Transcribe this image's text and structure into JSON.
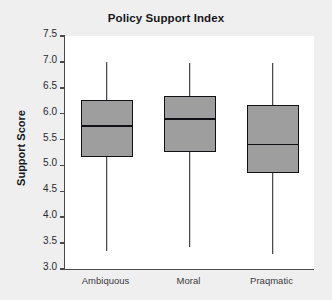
{
  "chart_data": {
    "type": "box",
    "title": "Policy Support Index",
    "xlabel": "",
    "ylabel": "Support Score",
    "categories": [
      "Ambiquous",
      "Moral",
      "Praqmatic"
    ],
    "ylim": [
      3.0,
      7.5
    ],
    "yticks": [
      "3.0",
      "3.5",
      "4.0",
      "4.5",
      "5.0",
      "5.5",
      "6.0",
      "6.5",
      "7.0",
      "7.5"
    ],
    "ytick_values": [
      3.0,
      3.5,
      4.0,
      4.5,
      5.0,
      5.5,
      6.0,
      6.5,
      7.0,
      7.5
    ],
    "grid": false,
    "legend": false,
    "boxes": [
      {
        "category": "Ambiquous",
        "whisker_low": 3.35,
        "q1": 5.16,
        "median": 5.78,
        "q3": 6.27,
        "whisker_high": 7.0
      },
      {
        "category": "Moral",
        "whisker_low": 3.42,
        "q1": 5.25,
        "median": 5.92,
        "q3": 6.35,
        "whisker_high": 6.98
      },
      {
        "category": "Praqmatic",
        "whisker_low": 3.28,
        "q1": 4.85,
        "median": 5.42,
        "q3": 6.16,
        "whisker_high": 6.98
      }
    ],
    "colors": {
      "box_fill": "#9e9e9e",
      "box_edge": "#121216",
      "plot_background": "#ffffff",
      "figure_background": "#efefef",
      "axis": "#4a4a4a",
      "text": "#16161a"
    }
  }
}
